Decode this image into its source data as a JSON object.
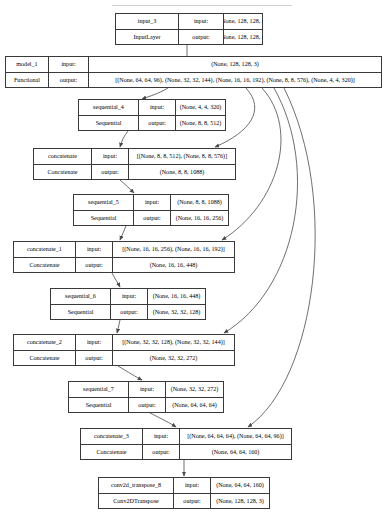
{
  "diagram": {
    "kind": "keras-model-plot",
    "type": "flowchart",
    "title": "",
    "canvas": {
      "width": 386,
      "height": 512
    },
    "colors": {
      "background": "#ffffff",
      "node_border": "#3a3a3a",
      "node_fill": "#ffffff",
      "edge": "#4a4a4a",
      "text": "#000000"
    },
    "labels": {
      "input_label": "input:",
      "output_label": "output:"
    },
    "nodes": [
      {
        "id": "input_3",
        "name": "input_3",
        "class_name": "InputLayer",
        "input_shape": "[(None, 128, 128, 3)]",
        "output_shape": "[(None, 128, 128, 3)]",
        "x": 115,
        "y": 13,
        "w": 148,
        "h": 32,
        "name_col": 56,
        "io_col": 38
      },
      {
        "id": "model_1",
        "name": "model_1",
        "class_name": "Functional",
        "input_shape": "(None, 128, 128, 3)",
        "output_shape": "[(None, 64, 64, 96), (None, 32, 32, 144), (None, 16, 16, 192), (None, 8, 8, 576), (None, 4, 4, 320)]",
        "x": 5,
        "y": 56,
        "w": 377,
        "h": 32,
        "name_col": 36,
        "io_col": 33
      },
      {
        "id": "sequential_4",
        "name": "sequential_4",
        "class_name": "Sequential",
        "input_shape": "(None, 4, 4, 320)",
        "output_shape": "(None, 8, 8, 512)",
        "x": 78,
        "y": 99,
        "w": 148,
        "h": 32,
        "name_col": 53,
        "io_col": 30
      },
      {
        "id": "concatenate",
        "name": "concatenate",
        "class_name": "Concatenate",
        "input_shape": "[(None, 8, 8, 512), (None, 8, 8, 576)]",
        "output_shape": "(None, 8, 8, 1088)",
        "x": 33,
        "y": 148,
        "w": 203,
        "h": 32,
        "name_col": 51,
        "io_col": 30
      },
      {
        "id": "sequential_5",
        "name": "sequential_5",
        "class_name": "Sequential",
        "input_shape": "(None, 8, 8, 1088)",
        "output_shape": "(None, 16, 16, 256)",
        "x": 73,
        "y": 194,
        "w": 156,
        "h": 32,
        "name_col": 53,
        "io_col": 30
      },
      {
        "id": "concatenate_1",
        "name": "concatenate_1",
        "class_name": "Concatenate",
        "input_shape": "[(None, 16, 16, 256), (None, 16, 16, 192)]",
        "output_shape": "(None, 16, 16, 448)",
        "x": 13,
        "y": 241,
        "w": 222,
        "h": 32,
        "name_col": 55,
        "io_col": 30
      },
      {
        "id": "sequential_6",
        "name": "sequential_6",
        "class_name": "Sequential",
        "input_shape": "(None, 16, 16, 448)",
        "output_shape": "(None, 32, 32, 128)",
        "x": 50,
        "y": 288,
        "w": 156,
        "h": 32,
        "name_col": 53,
        "io_col": 30
      },
      {
        "id": "concatenate_2",
        "name": "concatenate_2",
        "class_name": "Concatenate",
        "input_shape": "[(None, 32, 32, 128), (None, 32, 32, 144)]",
        "output_shape": "(None, 32, 32, 272)",
        "x": 13,
        "y": 334,
        "w": 222,
        "h": 32,
        "name_col": 55,
        "io_col": 30
      },
      {
        "id": "sequential_7",
        "name": "sequential_7",
        "class_name": "Sequential",
        "input_shape": "(None, 32, 32, 272)",
        "output_shape": "(None, 64, 64, 64)",
        "x": 68,
        "y": 381,
        "w": 156,
        "h": 32,
        "name_col": 53,
        "io_col": 30
      },
      {
        "id": "concatenate_3",
        "name": "concatenate_3",
        "class_name": "Concatenate",
        "input_shape": "[(None, 64, 64, 64), (None, 64, 64, 96)]",
        "output_shape": "(None, 64, 64, 160)",
        "x": 80,
        "y": 428,
        "w": 212,
        "h": 32,
        "name_col": 55,
        "io_col": 30
      },
      {
        "id": "conv2d_transpose_8",
        "name": "conv2d_transpose_8",
        "class_name": "Conv2DTranspose",
        "input_shape": "(None, 64, 64, 160)",
        "output_shape": "(None, 128, 128, 3)",
        "x": 98,
        "y": 477,
        "w": 172,
        "h": 32,
        "name_col": 68,
        "io_col": 30
      }
    ],
    "edges": [
      {
        "from": "input_3",
        "to": "model_1",
        "path": "M 187,45 L 187,50 L 187,88"
      },
      {
        "from": "model_1",
        "to": "sequential_4",
        "path": "M 168,88 C 158,94 150,96 142,99"
      },
      {
        "from": "model_1",
        "to": "concatenate",
        "path": "M 246,88 C 266,110 250,132 215,147"
      },
      {
        "from": "model_1",
        "to": "concatenate_1",
        "path": "M 262,88 C 300,130 278,205 222,240"
      },
      {
        "from": "model_1",
        "to": "concatenate_2",
        "path": "M 274,88 C 320,170 296,290 224,333"
      },
      {
        "from": "model_1",
        "to": "concatenate_3",
        "path": "M 284,88 C 340,200 316,380 248,427"
      },
      {
        "from": "sequential_4",
        "to": "concatenate",
        "path": "M 128,131 C 124,136 122,140 120,147"
      },
      {
        "from": "concatenate",
        "to": "sequential_5",
        "path": "M 120,180 C 126,185 130,189 134,193"
      },
      {
        "from": "sequential_5",
        "to": "concatenate_1",
        "path": "M 126,226 C 124,231 122,235 120,240"
      },
      {
        "from": "concatenate_1",
        "to": "sequential_6",
        "path": "M 112,273 C 115,279 118,283 120,287"
      },
      {
        "from": "sequential_6",
        "to": "concatenate_2",
        "path": "M 120,320 C 119,325 118,329 117,333"
      },
      {
        "from": "concatenate_2",
        "to": "sequential_7",
        "path": "M 118,366 C 128,372 136,377 142,380"
      },
      {
        "from": "sequential_7",
        "to": "concatenate_3",
        "path": "M 150,413 C 162,419 170,423 176,427"
      },
      {
        "from": "concatenate_3",
        "to": "conv2d_transpose_8",
        "path": "M 184,460 L 184,470 L 184,476"
      }
    ],
    "top_sliver": {
      "text": "",
      "visible": true
    }
  }
}
